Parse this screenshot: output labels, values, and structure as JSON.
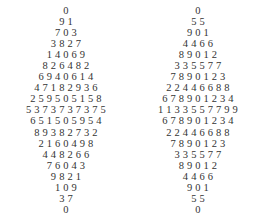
{
  "left_diamond": {
    "rows": [
      "0",
      "9 1",
      "7 0 3",
      "3 8 2 7",
      "1 4 0 6 9",
      "8 2 6 4 8 2",
      "6 9 4 0 6 1 4",
      "4 7 1 8 2 9 3 6",
      "2 5 9 5 0 5 1 5 8",
      "5 3 7 3 7 3 7 3 7 5",
      "6 5 1 5 0 5 9 5 4",
      "8 9 3 8 2 7 3 2",
      "2 1 6 0 4 9 8",
      "4 4 8 2 6 6",
      "7 6 0 4 3",
      "9 8 2 1",
      "1 0 9",
      "3 7",
      "0"
    ]
  },
  "right_diamond": {
    "rows": [
      "0",
      "5 5",
      "9 0 1",
      "4 4 6 6",
      "8 9 0 1 2",
      "3 3 5 5 7 7",
      "7 8 9 0 1 2 3",
      "2 2 4 4 6 6 8 8",
      "6 7 8 9 0 1 2 3 4",
      "1 1 3 3 5 5 7 7 9 9",
      "6 7 8 9 0 1 2 3 4",
      "2 2 4 4 6 6 8 8",
      "7 8 9 0 1 2 3",
      "3 3 5 5 7 7",
      "8 9 0 1 2",
      "4 4 6 6",
      "9 0 1",
      "5 5",
      "0"
    ]
  }
}
